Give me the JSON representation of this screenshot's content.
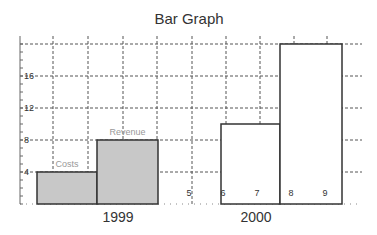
{
  "chart_data": {
    "type": "bar",
    "title": "Bar Graph",
    "xlabel": "",
    "ylabel": "",
    "ylim": [
      0,
      20
    ],
    "y_ticks": [
      "4",
      "8",
      "12",
      "16"
    ],
    "x_numeric_ticks": [
      "5",
      "6",
      "7",
      "8",
      "9"
    ],
    "groups": [
      "1999",
      "2000"
    ],
    "grid": true,
    "legend": "none",
    "bars": [
      {
        "group": "1999",
        "label": "Costs",
        "value": 4,
        "fill": "#c8c8c8"
      },
      {
        "group": "1999",
        "label": "Revenue",
        "value": 8,
        "fill": "#c8c8c8"
      },
      {
        "group": "2000",
        "label": "",
        "value": 10,
        "fill": "#ffffff"
      },
      {
        "group": "2000",
        "label": "",
        "value": 20,
        "fill": "#ffffff"
      }
    ]
  }
}
